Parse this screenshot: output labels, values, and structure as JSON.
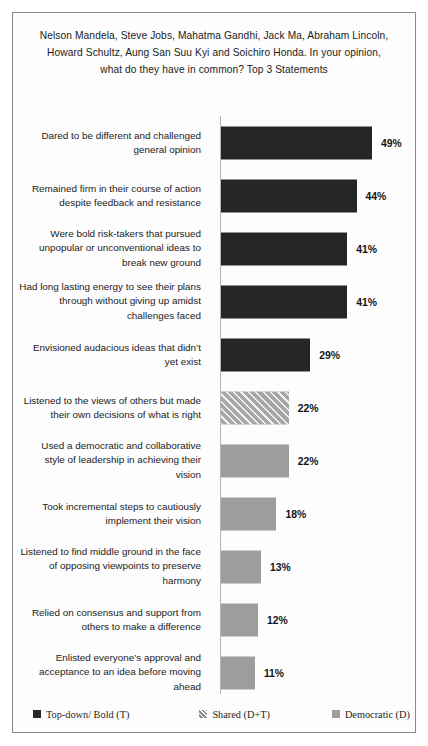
{
  "chart_data": {
    "type": "bar",
    "title": "Nelson Mandela, Steve Jobs, Mahatma Gandhi, Jack Ma, Abraham Lincoln, Howard Schultz, Aung San Suu Kyi and Soichiro Honda. In your opinion, what do they have in common? Top 3 Statements",
    "xlabel": "",
    "ylabel": "",
    "orientation": "horizontal",
    "grid": false,
    "xlim": [
      0,
      50
    ],
    "value_suffix": "%",
    "legend_position": "bottom",
    "px_per_percent": 3.08,
    "categories": [
      "Dared to be different and challenged general opinion",
      "Remained firm in their course of action despite feedback and resistance",
      "Were bold risk-takers that pursued unpopular or unconventional ideas to break new ground",
      "Had long lasting energy to see their plans through without giving up amidst challenges faced",
      "Envisioned audacious  ideas that didn’t yet exist",
      "Listened to the views of others but made their own decisions of what is right",
      "Used a democratic and collaborative style of leadership  in achieving their vision",
      "Took incremental steps to cautiously implement their vision",
      "Listened to find middle ground in the face of opposing viewpoints  to preserve harmony",
      "Relied on consensus and support from others to make a difference",
      "Enlisted everyone’s approval and acceptance to an idea before moving ahead"
    ],
    "values": [
      49,
      44,
      41,
      41,
      29,
      22,
      22,
      18,
      13,
      12,
      11
    ],
    "value_labels": [
      "49%",
      "44%",
      "41%",
      "41%",
      "29%",
      "22%",
      "22%",
      "18%",
      "13%",
      "12%",
      "11%"
    ],
    "series_of_bar": [
      "top-down",
      "top-down",
      "top-down",
      "top-down",
      "top-down",
      "shared",
      "democratic",
      "democratic",
      "democratic",
      "democratic",
      "democratic"
    ],
    "legend": [
      {
        "key": "top-down",
        "label": "Top-down/ Bold (T)",
        "style": "dark",
        "color": "#262626"
      },
      {
        "key": "shared",
        "label": "Shared (D+T)",
        "style": "hatch",
        "color": "#a6a6a6"
      },
      {
        "key": "democratic",
        "label": "Democratic (D)",
        "style": "gray",
        "color": "#9d9d9d"
      }
    ]
  }
}
